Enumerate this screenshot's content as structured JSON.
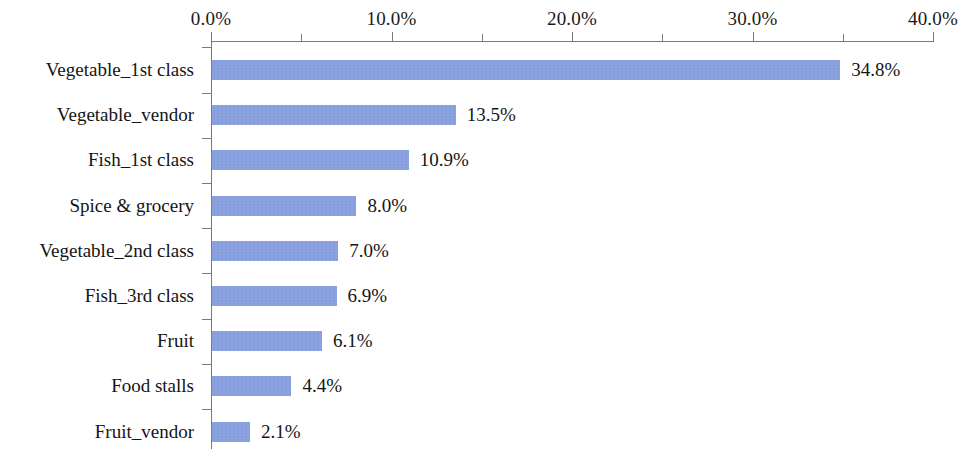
{
  "chart_data": {
    "type": "bar",
    "orientation": "horizontal",
    "title": "",
    "xlabel": "",
    "ylabel": "",
    "xlim": [
      0,
      40
    ],
    "x_tick_labels": [
      "0.0%",
      "10.0%",
      "20.0%",
      "30.0%",
      "40.0%"
    ],
    "x_tick_values": [
      0,
      10,
      20,
      30,
      40
    ],
    "x_minor_tick_values": [
      5,
      15,
      25,
      35
    ],
    "grid": false,
    "legend": false,
    "bar_color": "#8099dd",
    "axis_color": "#7b7b7b",
    "text_color": "#151515",
    "categories": [
      "Vegetable_1st class",
      "Vegetable_vendor",
      "Fish_1st class",
      "Spice & grocery",
      "Vegetable_2nd class",
      "Fish_3rd class",
      "Fruit",
      "Food stalls",
      "Fruit_vendor"
    ],
    "values": [
      34.8,
      13.5,
      10.9,
      8.0,
      7.0,
      6.9,
      6.1,
      4.4,
      2.1
    ],
    "data_labels": [
      "34.8%",
      "13.5%",
      "10.9%",
      "8.0%",
      "7.0%",
      "6.9%",
      "6.1%",
      "4.4%",
      "2.1%"
    ]
  }
}
